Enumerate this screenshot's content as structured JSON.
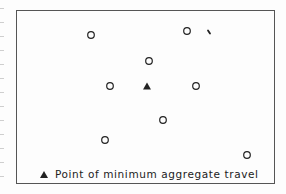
{
  "figure": {
    "legend": {
      "symbol": "triangle",
      "label": "Point of minimum aggregate travel"
    },
    "points": [
      {
        "x": 91,
        "y": 35,
        "type": "circle"
      },
      {
        "x": 187,
        "y": 31,
        "type": "circle"
      },
      {
        "x": 149,
        "y": 61,
        "type": "circle"
      },
      {
        "x": 110,
        "y": 86,
        "type": "circle"
      },
      {
        "x": 196,
        "y": 86,
        "type": "circle"
      },
      {
        "x": 163,
        "y": 120,
        "type": "circle"
      },
      {
        "x": 105,
        "y": 140,
        "type": "circle"
      },
      {
        "x": 247,
        "y": 155,
        "type": "circle"
      }
    ],
    "optimum": {
      "x": 147,
      "y": 86,
      "type": "triangle"
    },
    "artifact": {
      "x": 209,
      "y": 32
    },
    "colors": {
      "ink": "#222222",
      "frame": "#555555",
      "background": "#fdfdfd"
    }
  }
}
